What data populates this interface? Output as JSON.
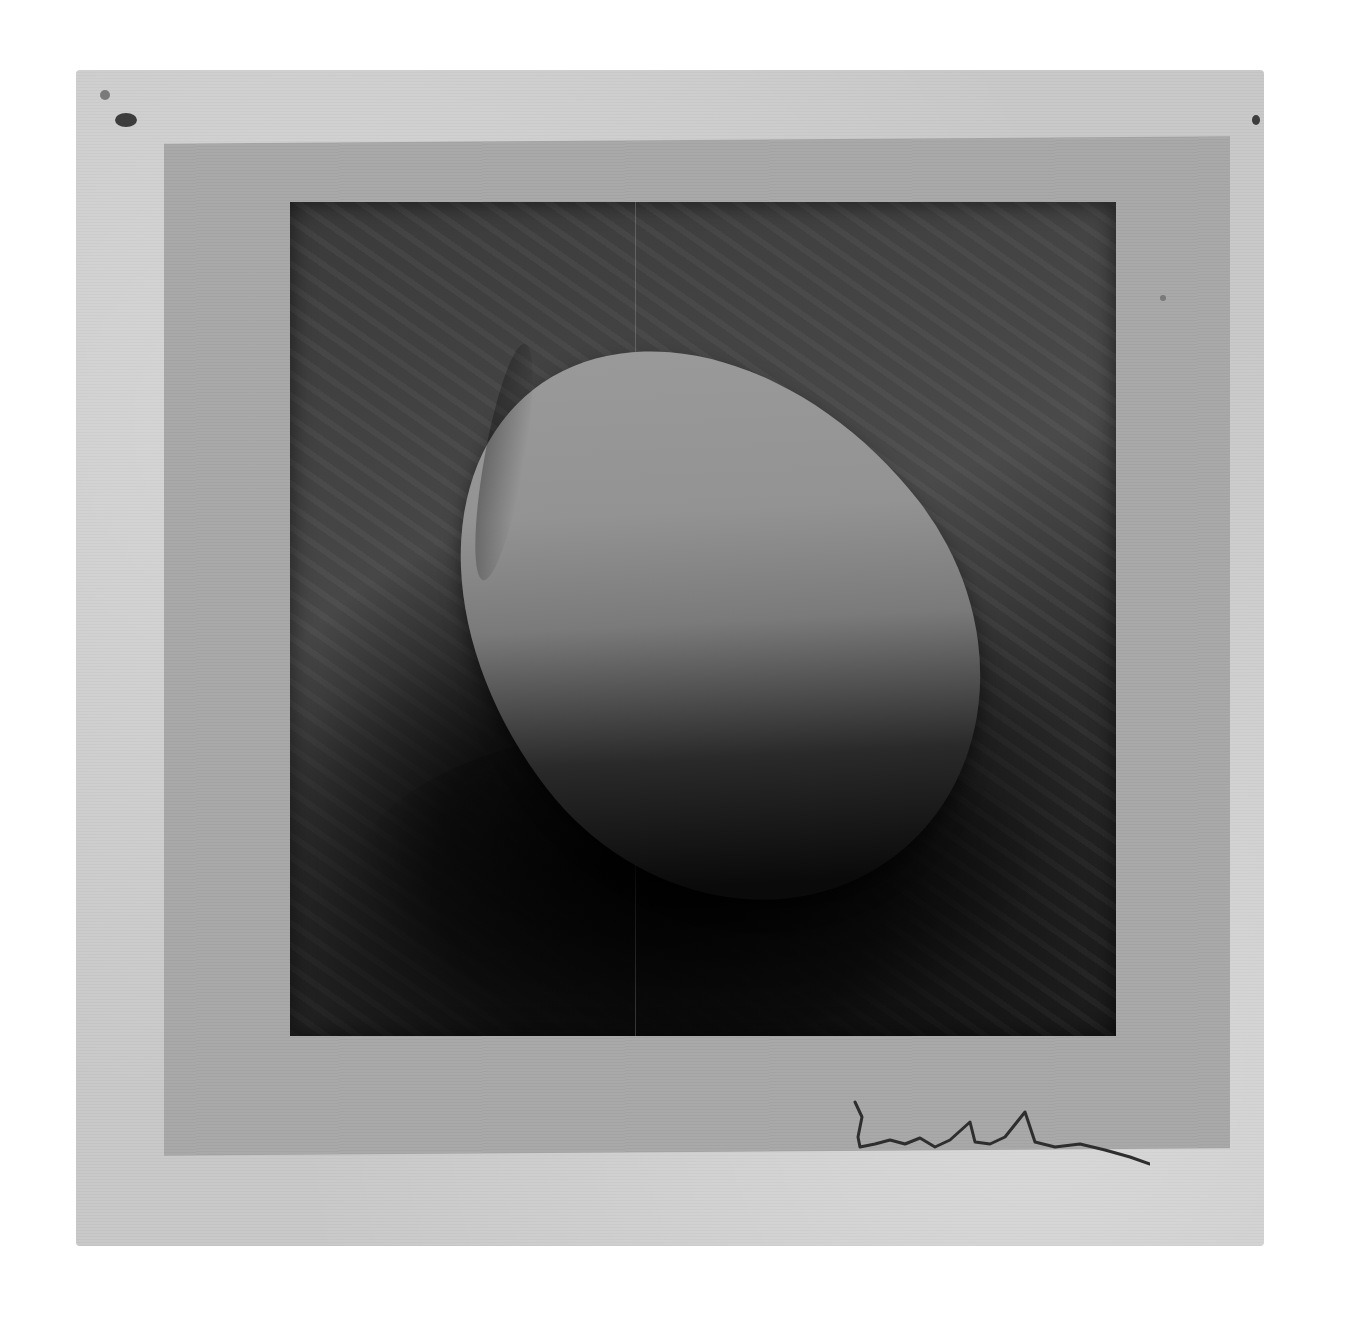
{
  "image": {
    "subject": "black-and-white photograph of an egg on a dark textured surface",
    "mount": "photograph mounted on gray mat over textured light-gray paper",
    "signature": "handwritten pencil signature, illegible",
    "colors": {
      "paper": "#c9c9c9",
      "mat": "#a9a9a9",
      "photo_background": "#3a3a3a",
      "egg_highlight": "#9d9d9d",
      "shadow": "#050505"
    }
  }
}
